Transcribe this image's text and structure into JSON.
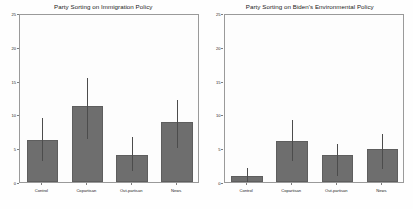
{
  "figure": {
    "background": "#ffffff",
    "bar_color": "#6e6e6e",
    "error_color": "#4c4c4c",
    "axis_color": "#9a9a9a"
  },
  "chart_data": [
    {
      "type": "bar",
      "title": "Party Sorting on Immigration Policy",
      "xlabel": "",
      "ylabel": "Percentage Who Sorted Post-Treatment",
      "categories": [
        "Control",
        "Copartisan",
        "Out-partisan",
        "News"
      ],
      "values": [
        6.2,
        11.2,
        4.0,
        8.9
      ],
      "error_low": [
        3.1,
        6.4,
        1.6,
        5.0
      ],
      "error_high": [
        9.4,
        15.4,
        6.6,
        12.1
      ],
      "ylim": [
        0,
        25
      ],
      "yticks": [
        0,
        5,
        10,
        15,
        20,
        25
      ],
      "grid": false,
      "legend": "none"
    },
    {
      "type": "bar",
      "title": "Party Sorting on Biden's Environmental Policy",
      "xlabel": "",
      "ylabel": "",
      "categories": [
        "Control",
        "Copartisan",
        "Out-partisan",
        "News"
      ],
      "values": [
        0.9,
        6.0,
        4.0,
        4.9
      ],
      "error_low": [
        0.0,
        3.1,
        0.9,
        1.9
      ],
      "error_high": [
        2.1,
        9.2,
        5.6,
        7.1
      ],
      "ylim": [
        0,
        25
      ],
      "yticks": [
        0,
        5,
        10,
        15,
        20,
        25
      ],
      "grid": false,
      "legend": "none"
    }
  ]
}
